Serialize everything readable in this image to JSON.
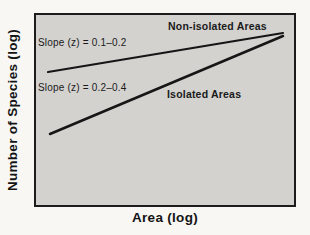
{
  "figure": {
    "y_axis_label": "Number of Species (log)",
    "x_axis_label": "Area (log)",
    "annotations": {
      "slope_non_isolated": "Slope (z) = 0.1–0.2",
      "slope_isolated": "Slope (z) = 0.2–0.4",
      "non_isolated": "Non-isolated Areas",
      "isolated": "Isolated Areas"
    },
    "colors": {
      "page_bg": "#f8f7f4",
      "plot_bg": "#d3d2cf",
      "frame_border": "#1c1c1c",
      "line": "#161616",
      "text": "#1a1a1a"
    }
  },
  "chart_data": {
    "type": "line",
    "title": "",
    "xlabel": "Area (log)",
    "ylabel": "Number of Species (log)",
    "axes": "schematic log–log axes, no tick marks or tick labels",
    "grid": false,
    "legend_position": "inline annotations",
    "series": [
      {
        "id": "non-isolated",
        "name": "Non-isolated Areas",
        "slope_z": "0.1–0.2",
        "slope_annotation": "Slope (z) = 0.1–0.2",
        "points_px": [
          [
            12,
            57
          ],
          [
            247,
            18
          ]
        ],
        "stroke_width": 2.2
      },
      {
        "id": "isolated",
        "name": "Isolated Areas",
        "slope_z": "0.2–0.4",
        "slope_annotation": "Slope (z) = 0.2–0.4",
        "points_px": [
          [
            14,
            119
          ],
          [
            247,
            21
          ]
        ],
        "stroke_width": 2.5
      }
    ]
  }
}
